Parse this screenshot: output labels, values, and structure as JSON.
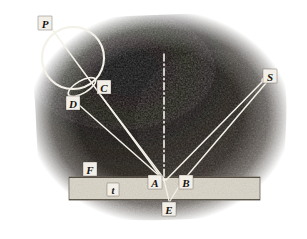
{
  "figure": {
    "type": "optical-ray-diagram",
    "canvas": {
      "width": 307,
      "height": 239
    },
    "colors": {
      "paper": "#ffffff",
      "charcoal_dark": "#1b1713",
      "charcoal_mid": "#3a322b",
      "charcoal_light": "#6d6259",
      "slab_fill": "#ddd8cc",
      "slab_edge": "#8a8275",
      "ray": "#f4f1e8",
      "label_text": "#17130f",
      "label_box": "#f2efe8"
    },
    "background": {
      "name": "charcoal-wash",
      "description": "hand-shaded dark charcoal field with feathered irregular edges on white paper"
    },
    "slab": {
      "name": "glass-plate",
      "x": 69,
      "y": 177,
      "width": 191,
      "height": 23,
      "thickness_label": "t"
    },
    "normal_line": {
      "name": "normal-dash-dot-line",
      "x": 164,
      "y1": 54,
      "y2": 181,
      "style": "dash-dot"
    },
    "circle": {
      "name": "eyepiece-circle",
      "cx": 73,
      "cy": 58,
      "r": 31
    },
    "ellipse": {
      "name": "lens-ellipse",
      "cx": 82,
      "cy": 87,
      "rx": 15,
      "ry": 6,
      "rotation": -32
    },
    "points": [
      {
        "id": "P",
        "label": "P",
        "x": 45,
        "y": 23,
        "box": true
      },
      {
        "id": "C",
        "label": "C",
        "x": 104,
        "y": 87,
        "box": true
      },
      {
        "id": "D",
        "label": "D",
        "x": 73,
        "y": 103,
        "box": true
      },
      {
        "id": "S",
        "label": "S",
        "x": 270,
        "y": 76,
        "box": true
      },
      {
        "id": "F",
        "label": "F",
        "x": 90,
        "y": 169,
        "box": true
      },
      {
        "id": "t",
        "label": "t",
        "x": 113,
        "y": 190,
        "box": true
      },
      {
        "id": "A",
        "label": "A",
        "x": 155,
        "y": 182,
        "box": true
      },
      {
        "id": "B",
        "label": "B",
        "x": 186,
        "y": 182,
        "box": true
      },
      {
        "id": "E",
        "label": "E",
        "x": 169,
        "y": 209,
        "box": true
      }
    ],
    "rays": [
      {
        "name": "ray-P-to-A",
        "x1": 52,
        "y1": 29,
        "x2": 163,
        "y2": 180
      },
      {
        "name": "ray-D-to-A",
        "x1": 70,
        "y1": 97,
        "x2": 164,
        "y2": 180
      },
      {
        "name": "ray-C-to-A",
        "x1": 98,
        "y1": 93,
        "x2": 165,
        "y2": 180
      },
      {
        "name": "ray-S-to-A",
        "x1": 265,
        "y1": 80,
        "x2": 166,
        "y2": 180
      },
      {
        "name": "ray-S-to-B",
        "x1": 266,
        "y1": 82,
        "x2": 180,
        "y2": 183
      },
      {
        "name": "ray-A-to-E",
        "x1": 164,
        "y1": 180,
        "x2": 169,
        "y2": 201
      },
      {
        "name": "ray-B-to-E",
        "x1": 180,
        "y1": 183,
        "x2": 170,
        "y2": 201
      }
    ],
    "markers": [
      {
        "name": "source-point-S",
        "x": 264,
        "y": 80,
        "r": 2.6
      }
    ]
  }
}
